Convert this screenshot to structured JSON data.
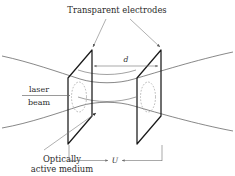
{
  "figure": {
    "background_color": "#ffffff",
    "ink_color": "#1a1a1a",
    "labels": {
      "electrodes": "Transparent electrodes",
      "laser_line1": "laser",
      "laser_line2": "beam",
      "medium_line1": "Optically",
      "medium_line2": "active medium",
      "gap_dimension": "d",
      "voltage_dimension": "U"
    }
  },
  "diagram_data": {
    "type": "technical-illustration",
    "description": "Perspective drawing of a laser beam focused through two parallel transparent electrode plates containing an optically active medium, with plate separation d and applied voltage U.",
    "components": [
      {
        "name": "left-electrode-plate",
        "shape": "parallelogram",
        "role": "transparent electrode"
      },
      {
        "name": "right-electrode-plate",
        "shape": "parallelogram",
        "role": "transparent electrode"
      },
      {
        "name": "beam-envelope",
        "shape": "hyperbolic waist",
        "role": "converging then diverging laser beam"
      },
      {
        "name": "beam-cross-section-left",
        "shape": "dotted ellipse",
        "role": "beam footprint on left plate"
      },
      {
        "name": "beam-cross-section-right",
        "shape": "dotted ellipse",
        "role": "beam footprint on right plate"
      }
    ],
    "dimensions": [
      {
        "symbol": "d",
        "meaning": "separation between electrodes",
        "orientation": "horizontal, above beam"
      },
      {
        "symbol": "U",
        "meaning": "applied voltage across electrodes",
        "orientation": "horizontal, below plates"
      }
    ],
    "annotations": [
      {
        "text": "Transparent electrodes",
        "points_to": [
          "left-electrode-plate",
          "right-electrode-plate"
        ],
        "position": "top"
      },
      {
        "text": "laser beam",
        "points_to": "beam-envelope",
        "position": "left"
      },
      {
        "text": "Optically active medium",
        "points_to": "medium-between-plates",
        "position": "bottom-left"
      }
    ]
  }
}
